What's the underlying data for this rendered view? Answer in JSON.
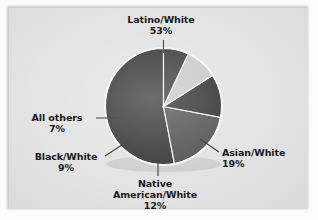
{
  "figure": {
    "background_color": "#e2e2e2",
    "frame_color": "#fcfcfc"
  },
  "chart_data": {
    "type": "pie",
    "title": "",
    "subtitle": "",
    "xlabel": "",
    "ylabel": "",
    "legend_position": "none",
    "grid": false,
    "start_angle_deg": 0,
    "direction": "clockwise",
    "categories": [
      "Latino/White",
      "Asian/White",
      "Native American/White",
      "Black/White",
      "All others"
    ],
    "values": [
      53,
      19,
      12,
      9,
      7
    ],
    "value_unit": "percent",
    "colors": [
      "#2e2e2e",
      "#4b4b4b",
      "#2a2a2a",
      "#c7c7c7",
      "#343434"
    ],
    "slices": [
      {
        "label": "Latino/White",
        "label_line1": "Latino/White",
        "label_line2": "",
        "value": 53,
        "value_text": "53%",
        "color": "#2e2e2e",
        "start_deg": 0,
        "end_deg": 190.8,
        "leader": "vertical-top"
      },
      {
        "label": "Asian/White",
        "label_line1": "Asian/White",
        "label_line2": "",
        "value": 19,
        "value_text": "19%",
        "color": "#4b4b4b",
        "start_deg": 190.8,
        "end_deg": 259.2,
        "leader": "diagonal-right"
      },
      {
        "label": "Native American/White",
        "label_line1": "Native",
        "label_line2": "American/White",
        "value": 12,
        "value_text": "12%",
        "color": "#2a2a2a",
        "start_deg": 259.2,
        "end_deg": 302.4,
        "leader": "vertical-bottom"
      },
      {
        "label": "Black/White",
        "label_line1": "Black/White",
        "label_line2": "",
        "value": 9,
        "value_text": "9%",
        "color": "#c7c7c7",
        "start_deg": 302.4,
        "end_deg": 334.8,
        "leader": "diagonal-left-lower"
      },
      {
        "label": "All others",
        "label_line1": "All others",
        "label_line2": "",
        "value": 7,
        "value_text": "7%",
        "color": "#343434",
        "start_deg": 334.8,
        "end_deg": 360,
        "leader": "horizontal-left"
      }
    ]
  }
}
